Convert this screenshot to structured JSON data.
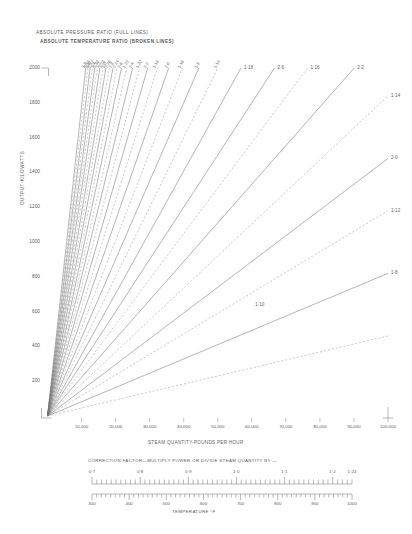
{
  "titles": {
    "line1": "ABSOLUTE PRESSURE RATIO (FULL LINES)",
    "line2": "ABSOLUTE TEMPERATURE RATIO (BROKEN LINES)"
  },
  "axes": {
    "y_label": "OUTPUT-KILOWATTS",
    "x_label": "STEAM QUANTITY-POUNDS PER HOUR",
    "y_ticks": [
      "2000",
      "1800",
      "1600",
      "1400",
      "1200",
      "1000",
      "800",
      "600",
      "400",
      "200"
    ],
    "x_ticks": [
      "10,000",
      "20,000",
      "30,000",
      "40,000",
      "50,000",
      "60,000",
      "70,000",
      "80,000",
      "90,000",
      "100,000"
    ]
  },
  "correction": {
    "title": "CORRECTION FACTOR—MULTIPLY POWER OR DIVIDE STEAM  QUANTITY BY:—",
    "scale_labels": [
      "0·7",
      "0·8",
      "0·9",
      "1·0",
      "1·1",
      "1·2",
      "1·24"
    ],
    "temperature_labels": [
      "300",
      "400",
      "500",
      "600",
      "700",
      "800",
      "900",
      "1000"
    ],
    "temperature_title": "TEMPERATURE °F"
  },
  "chart_data": {
    "type": "line",
    "xlabel": "STEAM QUANTITY-POUNDS PER HOUR",
    "ylabel": "OUTPUT-KILOWATTS",
    "xlim": [
      0,
      100000
    ],
    "ylim": [
      0,
      2000
    ],
    "grid": false,
    "legend": "inline-line-labels",
    "series": [
      {
        "name": "3·8",
        "style": "solid",
        "label_edge": "top",
        "slope_kw_per_lb": 0.178
      },
      {
        "name": "2·34",
        "style": "dashed",
        "label_edge": "top",
        "slope_kw_per_lb": 0.169
      },
      {
        "name": "3·6",
        "style": "solid",
        "label_edge": "top",
        "slope_kw_per_lb": 0.16
      },
      {
        "name": "2·32",
        "style": "dashed",
        "label_edge": "top",
        "slope_kw_per_lb": 0.152
      },
      {
        "name": "3·4",
        "style": "solid",
        "label_edge": "top",
        "slope_kw_per_lb": 0.144
      },
      {
        "name": "2·30",
        "style": "dashed",
        "label_edge": "top",
        "slope_kw_per_lb": 0.137
      },
      {
        "name": "3·2",
        "style": "solid",
        "label_edge": "top",
        "slope_kw_per_lb": 0.13
      },
      {
        "name": "2·28",
        "style": "dashed",
        "label_edge": "top",
        "slope_kw_per_lb": 0.123
      },
      {
        "name": "3·0",
        "style": "solid",
        "label_edge": "top",
        "slope_kw_per_lb": 0.1165
      },
      {
        "name": "2·26",
        "style": "dashed",
        "label_edge": "top",
        "slope_kw_per_lb": 0.11
      },
      {
        "name": "2·8",
        "style": "solid",
        "label_edge": "top",
        "slope_kw_per_lb": 0.104
      },
      {
        "name": "2·24",
        "style": "dashed",
        "label_edge": "top",
        "slope_kw_per_lb": 0.098
      },
      {
        "name": "2·6",
        "style": "solid",
        "label_edge": "top",
        "slope_kw_per_lb": 0.092
      },
      {
        "name": "1·22",
        "style": "dashed",
        "label_edge": "top",
        "slope_kw_per_lb": 0.086
      },
      {
        "name": "2·4",
        "style": "solid",
        "label_edge": "top",
        "slope_kw_per_lb": 0.08
      },
      {
        "name": "1·20",
        "style": "dashed",
        "label_edge": "top",
        "slope_kw_per_lb": 0.074
      },
      {
        "name": "2·2",
        "style": "solid",
        "label_edge": "top",
        "slope_kw_per_lb": 0.068
      },
      {
        "name": "1·18",
        "style": "dashed",
        "label_edge": "top",
        "slope_kw_per_lb": 0.062
      },
      {
        "name": "2·0",
        "style": "solid",
        "label_edge": "top",
        "slope_kw_per_lb": 0.0562
      },
      {
        "name": "1·16",
        "style": "dashed",
        "label_edge": "top",
        "slope_kw_per_lb": 0.0505
      },
      {
        "name": "1·8",
        "style": "solid",
        "label_edge": "top",
        "slope_kw_per_lb": 0.045
      },
      {
        "name": "1·14",
        "style": "dashed",
        "label_edge": "top",
        "slope_kw_per_lb": 0.04
      },
      {
        "name": "1·18",
        "style": "solid",
        "label_edge": "right",
        "slope_kw_per_lb": 0.0352
      },
      {
        "name": "2·6",
        "style": "solid",
        "label_edge": "right",
        "slope_kw_per_lb": 0.03
      },
      {
        "name": "1·16",
        "style": "dashed",
        "label_edge": "right",
        "slope_kw_per_lb": 0.0262
      },
      {
        "name": "2·2",
        "style": "solid",
        "label_edge": "right",
        "slope_kw_per_lb": 0.0222
      },
      {
        "name": "1·14",
        "style": "dashed",
        "label_edge": "right",
        "slope_kw_per_lb": 0.0184
      },
      {
        "name": "2·0",
        "style": "solid",
        "label_edge": "right",
        "slope_kw_per_lb": 0.0148
      },
      {
        "name": "1·12",
        "style": "dashed",
        "label_edge": "right",
        "slope_kw_per_lb": 0.0118
      },
      {
        "name": "1·8",
        "style": "solid",
        "label_edge": "right",
        "slope_kw_per_lb": 0.0082
      },
      {
        "name": "1·10",
        "style": "dashed",
        "label_edge": "inner",
        "slope_kw_per_lb": 0.0046
      }
    ],
    "top_edge_labels": [
      "3·8",
      "2·34",
      "3·6",
      "2·32",
      "3·4",
      "2·30",
      "3·2",
      "2·28",
      "3·0",
      "2·26",
      "2·8",
      "2·24",
      "2·6",
      "1·22",
      "2·4",
      "1·20",
      "2·2",
      "1·18",
      "2·0",
      "1·16",
      "1·8",
      "1·14"
    ],
    "right_edge_labels": [
      "1·18",
      "2·6",
      "1·16",
      "2·2",
      "1·14",
      "2·0",
      "1·12",
      "1·8"
    ],
    "inner_labels": [
      "1·10"
    ]
  }
}
